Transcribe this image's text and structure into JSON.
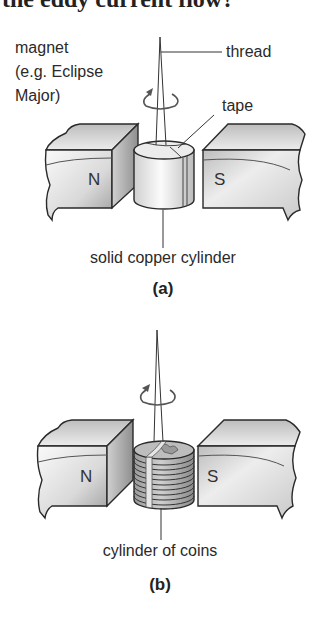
{
  "heading": "the eddy current flow?",
  "figure_a": {
    "labels": {
      "magnet_line1": "magnet",
      "magnet_line2": "(e.g. Eclipse",
      "magnet_line3": "Major)",
      "thread": "thread",
      "tape": "tape",
      "cylinder": "solid copper cylinder",
      "north": "N",
      "south": "S"
    },
    "caption": "(a)"
  },
  "figure_b": {
    "labels": {
      "cylinder": "cylinder of coins",
      "north": "N",
      "south": "S"
    },
    "caption": "(b)"
  },
  "colors": {
    "outline": "#2a2a2a",
    "magnet_light": "#f2f2f2",
    "magnet_dark": "#a8a8a8",
    "cylinder_light": "#f7f7f7",
    "cylinder_dark": "#c4c4c4"
  }
}
